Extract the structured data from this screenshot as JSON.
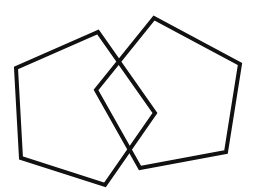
{
  "diagram": {
    "background": "#ffffff",
    "stroke_color": "#111111",
    "stroke_width": 4,
    "shapes": [
      {
        "name": "left-pentagon",
        "type": "pentagon",
        "points": "98,32 155,113 105,185 21,158 16,68"
      },
      {
        "name": "right-pentagon",
        "type": "pentagon",
        "points": "154,18 240,64 226,152 140,168 96,90"
      }
    ]
  }
}
